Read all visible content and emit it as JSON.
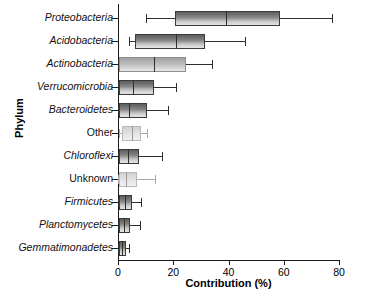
{
  "chart_data": {
    "type": "boxplot",
    "title": "",
    "xlabel": "Contribution (%)",
    "ylabel": "Phylum",
    "xlim": [
      0,
      80
    ],
    "xticks": [
      0,
      20,
      40,
      60,
      80
    ],
    "xtick_labels": [
      "0",
      "20",
      "40",
      "60",
      "80"
    ],
    "grid": false,
    "legend": "none",
    "orientation": "horizontal",
    "categories": [
      "Proteobacteria",
      "Acidobacteria",
      "Actinobacteria",
      "Verrucomicrobia",
      "Bacteroidetes",
      "Other",
      "Chloroflexi",
      "Unknown",
      "Firmicutes",
      "Planctomycetes",
      "Gemmatimonadetes"
    ],
    "boxes": [
      {
        "name": "Proteobacteria",
        "italic": true,
        "shade": "dark",
        "whisker_low": 10.0,
        "q1": 20.5,
        "median": 39.0,
        "q3": 58.5,
        "whisker_high": 77.5
      },
      {
        "name": "Acidobacteria",
        "italic": true,
        "shade": "dark",
        "whisker_low": 4.0,
        "q1": 6.0,
        "median": 21.0,
        "q3": 31.5,
        "whisker_high": 46.0
      },
      {
        "name": "Actinobacteria",
        "italic": true,
        "shade": "mid",
        "whisker_low": 0.0,
        "q1": 0.5,
        "median": 13.0,
        "q3": 24.5,
        "whisker_high": 34.0
      },
      {
        "name": "Verrucomicrobia",
        "italic": true,
        "shade": "dark",
        "whisker_low": 0.0,
        "q1": 0.5,
        "median": 5.5,
        "q3": 13.0,
        "whisker_high": 21.0
      },
      {
        "name": "Bacteroidetes",
        "italic": true,
        "shade": "dark",
        "whisker_low": 0.0,
        "q1": 0.5,
        "median": 4.0,
        "q3": 10.5,
        "whisker_high": 18.0
      },
      {
        "name": "Other",
        "italic": false,
        "shade": "light",
        "whisker_low": 0.5,
        "q1": 1.5,
        "median": 5.0,
        "q3": 8.5,
        "whisker_high": 10.5
      },
      {
        "name": "Chloroflexi",
        "italic": true,
        "shade": "dark",
        "whisker_low": 0.0,
        "q1": 0.5,
        "median": 3.5,
        "q3": 7.5,
        "whisker_high": 16.0
      },
      {
        "name": "Unknown",
        "italic": false,
        "shade": "light",
        "whisker_low": 0.0,
        "q1": 0.5,
        "median": 3.0,
        "q3": 7.0,
        "whisker_high": 13.5
      },
      {
        "name": "Firmicutes",
        "italic": true,
        "shade": "dark",
        "whisker_low": 0.0,
        "q1": 0.5,
        "median": 2.5,
        "q3": 5.0,
        "whisker_high": 8.5
      },
      {
        "name": "Planctomycetes",
        "italic": true,
        "shade": "dark",
        "whisker_low": 0.0,
        "q1": 0.5,
        "median": 2.0,
        "q3": 4.5,
        "whisker_high": 8.0
      },
      {
        "name": "Gemmatimonadetes",
        "italic": true,
        "shade": "dark",
        "whisker_low": 0.0,
        "q1": 0.5,
        "median": 1.5,
        "q3": 3.0,
        "whisker_high": 4.0
      }
    ]
  }
}
